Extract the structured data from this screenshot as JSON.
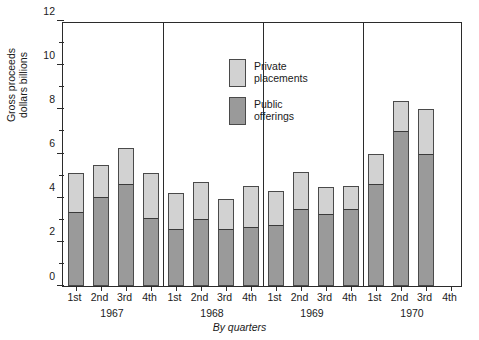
{
  "chart_data": {
    "type": "bar",
    "subtype": "stacked-bar",
    "title": "",
    "xlabel": "By quarters",
    "ylabel": "Gross proceeds\ndollars billions",
    "ylim": [
      0,
      12
    ],
    "y_major_ticks": [
      0,
      2,
      4,
      6,
      8,
      10,
      12
    ],
    "y_minor_ticks": [
      1,
      3,
      5,
      7,
      9,
      11
    ],
    "y_tick_labels": [
      "0",
      "2",
      "4",
      "6",
      "8",
      "10",
      "12"
    ],
    "grid": false,
    "legend_position": "top-center-inside",
    "legend": [
      {
        "name": "Private placements",
        "color": "#d2d2d2"
      },
      {
        "name": "Public offerings",
        "color": "#9a9a9a"
      }
    ],
    "groups": [
      "1967",
      "1968",
      "1969",
      "1970"
    ],
    "categories": [
      "1st",
      "2nd",
      "3rd",
      "4th",
      "1st",
      "2nd",
      "3rd",
      "4th",
      "1st",
      "2nd",
      "3rd",
      "4th",
      "1st",
      "2nd",
      "3rd",
      "4th"
    ],
    "series": [
      {
        "name": "Public offerings",
        "color": "#9a9a9a",
        "values": [
          3.35,
          4.05,
          4.6,
          3.1,
          2.6,
          3.05,
          2.6,
          2.65,
          2.75,
          3.5,
          3.25,
          3.5,
          4.6,
          7.0,
          6.0,
          null
        ]
      },
      {
        "name": "Private placements",
        "color": "#d2d2d2",
        "values": [
          1.75,
          1.45,
          1.65,
          2.0,
          1.6,
          1.65,
          1.35,
          1.9,
          1.55,
          1.65,
          1.25,
          1.05,
          1.4,
          1.4,
          2.0,
          null
        ]
      }
    ],
    "totals": [
      5.1,
      5.5,
      6.25,
      5.1,
      4.2,
      4.7,
      3.95,
      4.55,
      4.3,
      5.15,
      4.5,
      4.55,
      6.0,
      8.4,
      8.0,
      null
    ],
    "bars": [
      {
        "group": "1967",
        "quarter": "1st",
        "public": 3.35,
        "private": 1.75,
        "total": 5.1
      },
      {
        "group": "1967",
        "quarter": "2nd",
        "public": 4.05,
        "private": 1.45,
        "total": 5.5
      },
      {
        "group": "1967",
        "quarter": "3rd",
        "public": 4.6,
        "private": 1.65,
        "total": 6.25
      },
      {
        "group": "1967",
        "quarter": "4th",
        "public": 3.1,
        "private": 2.0,
        "total": 5.1
      },
      {
        "group": "1968",
        "quarter": "1st",
        "public": 2.6,
        "private": 1.6,
        "total": 4.2
      },
      {
        "group": "1968",
        "quarter": "2nd",
        "public": 3.05,
        "private": 1.65,
        "total": 4.7
      },
      {
        "group": "1968",
        "quarter": "3rd",
        "public": 2.6,
        "private": 1.35,
        "total": 3.95
      },
      {
        "group": "1968",
        "quarter": "4th",
        "public": 2.65,
        "private": 1.9,
        "total": 4.55
      },
      {
        "group": "1969",
        "quarter": "1st",
        "public": 2.75,
        "private": 1.55,
        "total": 4.3
      },
      {
        "group": "1969",
        "quarter": "2nd",
        "public": 3.5,
        "private": 1.65,
        "total": 5.15
      },
      {
        "group": "1969",
        "quarter": "3rd",
        "public": 3.25,
        "private": 1.25,
        "total": 4.5
      },
      {
        "group": "1969",
        "quarter": "4th",
        "public": 3.5,
        "private": 1.05,
        "total": 4.55
      },
      {
        "group": "1970",
        "quarter": "1st",
        "public": 4.6,
        "private": 1.4,
        "total": 6.0
      },
      {
        "group": "1970",
        "quarter": "2nd",
        "public": 7.0,
        "private": 1.4,
        "total": 8.4
      },
      {
        "group": "1970",
        "quarter": "3rd",
        "public": 6.0,
        "private": 2.0,
        "total": 8.0
      },
      {
        "group": "1970",
        "quarter": "4th",
        "public": null,
        "private": null,
        "total": null
      }
    ]
  }
}
